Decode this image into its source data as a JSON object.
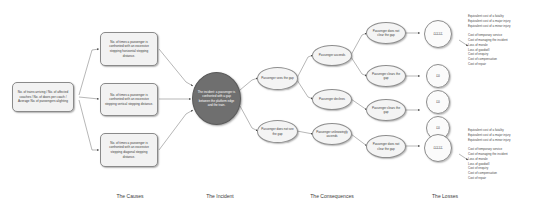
{
  "diagram": {
    "columns": [
      {
        "id": "causes",
        "label": "The Causes"
      },
      {
        "id": "incident",
        "label": "The Incident"
      },
      {
        "id": "consequences",
        "label": "The Consequences"
      },
      {
        "id": "losses",
        "label": "The Losses"
      }
    ],
    "causes": {
      "driver": "No. of trains arriving / No. of affected coaches / No. of doors per coach / Average No. of passengers alighting",
      "items": [
        "No. of times a passenger is confronted with an excessive stepping horizontal stepping distance.",
        "No. of times a passenger is confronted with an excessive stepping vertical stepping distance.",
        "No. of times a passenger is confronted with an excessive stepping diagonal stepping distance."
      ]
    },
    "incident": {
      "label": "The incident: a passenger is confronted with a gap between the platform edge and the train."
    },
    "consequences": {
      "stage1": [
        "Passenger sees the gap",
        "Passenger does not see the gap"
      ],
      "stage2": [
        "Passenger ascends",
        "Passenger declines",
        "Passenger unknowingly ascends"
      ],
      "stage3": [
        "Passenger does not clear the gap",
        "Passenger clears the gap",
        "Passenger clears the gap",
        "Passenger does not clear the gap"
      ]
    },
    "losses": {
      "outcomes": [
        {
          "id": "loss-top",
          "value": "£££££"
        },
        {
          "id": "loss-zero-1",
          "value": "£0"
        },
        {
          "id": "loss-zero-2",
          "value": "£0"
        },
        {
          "id": "loss-zero-3",
          "value": "£0"
        },
        {
          "id": "loss-bottom",
          "value": "£££££"
        }
      ],
      "equivalent_costs": [
        "Equivalent cost of a fatality",
        "Equivalent cost of a major injury",
        "Equivalent cost of a minor injury"
      ],
      "incident_costs": [
        "Cost of temporary service",
        "Cost of managing the incident",
        "Loss of morale",
        "Loss of goodwill",
        "Cost of enquiry",
        "Cost of compensation",
        "Cost of repair"
      ]
    },
    "colors": {
      "incident_fill": "#6f6f6f",
      "node_fill": "#f2f2f2",
      "stroke": "#8a8a8a",
      "text": "#3d3d3d",
      "background": "#ffffff"
    }
  }
}
